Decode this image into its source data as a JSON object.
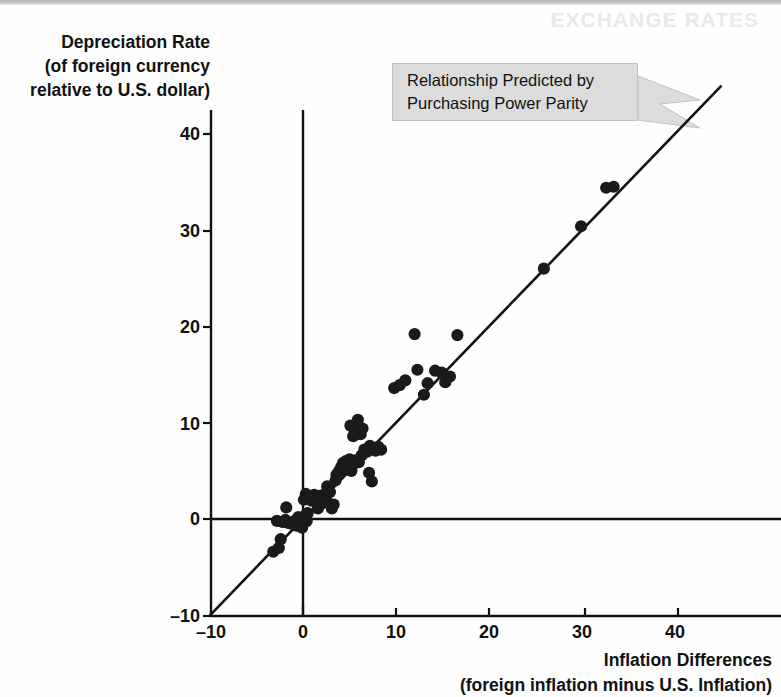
{
  "figure": {
    "ghost_text": "EXCHANGE RATES",
    "y_axis": {
      "title_lines": [
        "Depreciation Rate",
        "(of foreign currency",
        "relative to U.S. dollar)"
      ],
      "ticks": [
        "40",
        "30",
        "20",
        "10",
        "0",
        "–10"
      ]
    },
    "x_axis": {
      "title_lines": [
        "Inflation Differences",
        "(foreign inflation minus U.S. Inflation)"
      ],
      "ticks": [
        "–10",
        "0",
        "10",
        "20",
        "30",
        "40"
      ]
    },
    "callout": {
      "line1": "Relationship Predicted by",
      "line2": "Purchasing Power Parity"
    },
    "colors": {
      "ink": "#111111",
      "point": "#1a1a1a",
      "callout_fill": "#dcdcdc",
      "callout_stroke": "#c2c2c2",
      "background": "#fefefe"
    }
  },
  "chart_data": {
    "type": "scatter",
    "title": "",
    "xlabel": "Inflation Differences (foreign inflation minus U.S. Inflation)",
    "ylabel": "Depreciation Rate (of foreign currency relative to U.S. dollar)",
    "xlim": [
      -10,
      47
    ],
    "ylim": [
      -10,
      45
    ],
    "xticks": [
      -10,
      0,
      10,
      20,
      30,
      40
    ],
    "yticks": [
      -10,
      0,
      10,
      20,
      30,
      40
    ],
    "grid": false,
    "legend": null,
    "annotations": [
      {
        "text": "Relationship Predicted by Purchasing Power Parity",
        "points_to": "45-degree reference line",
        "x": 8.5,
        "y": 41
      }
    ],
    "reference_line": {
      "label": "Relationship Predicted by Purchasing Power Parity",
      "type": "line",
      "slope": 1,
      "intercept": 0,
      "x_start": -10,
      "x_end": 45
    },
    "series": [
      {
        "name": "Country observations",
        "marker": "filled-circle",
        "color": "#1a1a1a",
        "points": [
          [
            -3.2,
            -3.4
          ],
          [
            -2.6,
            -3.0
          ],
          [
            -2.4,
            -2.1
          ],
          [
            -2.8,
            -0.2
          ],
          [
            -2.2,
            -0.3
          ],
          [
            -1.9,
            -0.1
          ],
          [
            -1.6,
            -0.4
          ],
          [
            -1.8,
            1.2
          ],
          [
            -1.2,
            -0.5
          ],
          [
            -0.9,
            -0.2
          ],
          [
            -0.7,
            -0.7
          ],
          [
            -0.5,
            0.2
          ],
          [
            -0.4,
            -0.6
          ],
          [
            -0.2,
            -0.1
          ],
          [
            -0.1,
            -0.9
          ],
          [
            0.0,
            -0.5
          ],
          [
            0.1,
            0.1
          ],
          [
            0.2,
            -0.3
          ],
          [
            0.3,
            0.4
          ],
          [
            0.4,
            -0.2
          ],
          [
            0.5,
            0.6
          ],
          [
            0.1,
            2.0
          ],
          [
            0.3,
            2.6
          ],
          [
            0.6,
            2.2
          ],
          [
            0.9,
            1.9
          ],
          [
            1.2,
            2.5
          ],
          [
            1.4,
            2.3
          ],
          [
            1.6,
            1.1
          ],
          [
            1.8,
            2.4
          ],
          [
            2.0,
            1.6
          ],
          [
            2.2,
            2.5
          ],
          [
            2.5,
            2.0
          ],
          [
            2.6,
            3.4
          ],
          [
            2.9,
            2.8
          ],
          [
            3.1,
            1.1
          ],
          [
            3.3,
            1.5
          ],
          [
            3.5,
            4.0
          ],
          [
            3.6,
            4.6
          ],
          [
            3.9,
            5.0
          ],
          [
            4.1,
            5.4
          ],
          [
            4.3,
            5.8
          ],
          [
            4.4,
            5.1
          ],
          [
            4.6,
            6.0
          ],
          [
            4.8,
            5.5
          ],
          [
            5.0,
            6.2
          ],
          [
            5.2,
            5.0
          ],
          [
            5.4,
            5.7
          ],
          [
            5.6,
            6.1
          ],
          [
            5.1,
            9.7
          ],
          [
            5.4,
            8.6
          ],
          [
            5.6,
            9.1
          ],
          [
            5.9,
            10.3
          ],
          [
            6.2,
            8.8
          ],
          [
            6.4,
            9.4
          ],
          [
            6.0,
            5.9
          ],
          [
            6.3,
            6.6
          ],
          [
            6.6,
            7.2
          ],
          [
            6.9,
            7.0
          ],
          [
            7.2,
            7.6
          ],
          [
            7.5,
            7.3
          ],
          [
            7.1,
            4.8
          ],
          [
            7.4,
            3.9
          ],
          [
            7.8,
            7.1
          ],
          [
            8.1,
            7.5
          ],
          [
            8.4,
            7.2
          ],
          [
            9.8,
            13.6
          ],
          [
            10.4,
            13.9
          ],
          [
            11.0,
            14.4
          ],
          [
            12.0,
            19.2
          ],
          [
            12.3,
            15.5
          ],
          [
            13.0,
            12.9
          ],
          [
            13.4,
            14.1
          ],
          [
            14.2,
            15.4
          ],
          [
            14.9,
            15.2
          ],
          [
            15.3,
            14.2
          ],
          [
            15.8,
            14.8
          ],
          [
            16.6,
            19.1
          ],
          [
            25.9,
            26.0
          ],
          [
            29.9,
            30.4
          ],
          [
            32.6,
            34.4
          ],
          [
            33.4,
            34.5
          ]
        ]
      }
    ]
  }
}
